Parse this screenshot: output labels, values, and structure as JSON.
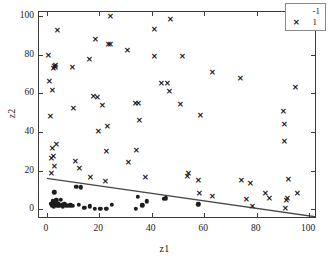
{
  "chart_data": {
    "type": "scatter",
    "title": "",
    "xlabel": "z1",
    "ylabel": "z2",
    "xlim": [
      -3,
      103
    ],
    "ylim": [
      -5,
      102
    ],
    "xticks": [
      0,
      20,
      40,
      60,
      80,
      100
    ],
    "yticks": [
      0,
      20,
      40,
      60,
      80,
      100
    ],
    "grid": false,
    "legend_position": "upper-right",
    "series": [
      {
        "name": "-1",
        "marker": "filled-circle",
        "color": "#1c1c1c",
        "points": [
          [
            1.5,
            3.0
          ],
          [
            2.0,
            2.0
          ],
          [
            2.2,
            4.2
          ],
          [
            2.6,
            1.6
          ],
          [
            3.0,
            3.4
          ],
          [
            3.3,
            2.2
          ],
          [
            3.6,
            4.6
          ],
          [
            2.8,
            8.8
          ],
          [
            4.0,
            2.0
          ],
          [
            4.4,
            3.0
          ],
          [
            4.8,
            1.8
          ],
          [
            5.2,
            5.0
          ],
          [
            5.6,
            2.4
          ],
          [
            6.0,
            1.6
          ],
          [
            6.6,
            2.8
          ],
          [
            7.2,
            2.0
          ],
          [
            8.0,
            1.8
          ],
          [
            9.0,
            2.0
          ],
          [
            10.0,
            1.8
          ],
          [
            11.2,
            11.6
          ],
          [
            12.2,
            2.2
          ],
          [
            13.0,
            11.4
          ],
          [
            14.2,
            0.8
          ],
          [
            16.4,
            1.6
          ],
          [
            18.2,
            0.2
          ],
          [
            20.4,
            0.2
          ],
          [
            22.6,
            0.4
          ],
          [
            24.8,
            2.2
          ],
          [
            33.8,
            0.4
          ],
          [
            34.6,
            6.4
          ],
          [
            36.4,
            2.0
          ],
          [
            38.2,
            4.2
          ],
          [
            44.6,
            5.4
          ],
          [
            45.4,
            5.6
          ],
          [
            57.8,
            2.6
          ]
        ]
      },
      {
        "name": "1",
        "marker": "x",
        "color": "#1c1c1c",
        "points": [
          [
            0.6,
            79.2
          ],
          [
            1.0,
            65.8
          ],
          [
            1.2,
            47.8
          ],
          [
            1.4,
            18.4
          ],
          [
            1.6,
            26.2
          ],
          [
            1.8,
            31.0
          ],
          [
            2.0,
            61.0
          ],
          [
            2.4,
            72.4
          ],
          [
            2.8,
            73.6
          ],
          [
            3.0,
            73.0
          ],
          [
            3.2,
            74.0
          ],
          [
            2.2,
            27.0
          ],
          [
            2.6,
            22.0
          ],
          [
            3.6,
            33.4
          ],
          [
            4.0,
            92.0
          ],
          [
            9.6,
            73.0
          ],
          [
            10.0,
            52.0
          ],
          [
            10.6,
            24.4
          ],
          [
            12.4,
            21.0
          ],
          [
            16.0,
            77.4
          ],
          [
            16.4,
            16.2
          ],
          [
            17.6,
            58.0
          ],
          [
            18.4,
            87.4
          ],
          [
            19.2,
            57.6
          ],
          [
            19.6,
            40.0
          ],
          [
            21.0,
            53.6
          ],
          [
            22.0,
            14.0
          ],
          [
            22.6,
            29.6
          ],
          [
            23.0,
            42.6
          ],
          [
            23.4,
            85.0
          ],
          [
            24.0,
            85.2
          ],
          [
            24.2,
            99.4
          ],
          [
            30.4,
            81.6
          ],
          [
            30.8,
            24.2
          ],
          [
            33.6,
            54.4
          ],
          [
            34.0,
            30.0
          ],
          [
            34.6,
            54.6
          ],
          [
            35.0,
            45.4
          ],
          [
            37.4,
            16.4
          ],
          [
            40.8,
            78.6
          ],
          [
            41.0,
            92.6
          ],
          [
            43.4,
            64.6
          ],
          [
            45.8,
            64.8
          ],
          [
            46.4,
            60.6
          ],
          [
            46.8,
            98.0
          ],
          [
            50.6,
            54.0
          ],
          [
            51.4,
            78.8
          ],
          [
            53.6,
            16.8
          ],
          [
            54.0,
            18.4
          ],
          [
            57.6,
            14.8
          ],
          [
            58.0,
            7.8
          ],
          [
            58.4,
            48.0
          ],
          [
            62.8,
            6.6
          ],
          [
            63.0,
            70.4
          ],
          [
            73.6,
            67.6
          ],
          [
            74.2,
            14.8
          ],
          [
            75.8,
            4.8
          ],
          [
            77.6,
            13.2
          ],
          [
            78.4,
            1.2
          ],
          [
            83.2,
            8.0
          ],
          [
            84.8,
            5.4
          ],
          [
            90.0,
            50.2
          ],
          [
            90.4,
            35.0
          ],
          [
            90.6,
            43.8
          ],
          [
            90.8,
            0.2
          ],
          [
            91.0,
            4.4
          ],
          [
            91.6,
            5.2
          ],
          [
            92.0,
            15.4
          ],
          [
            94.8,
            62.8
          ],
          [
            95.2,
            7.8
          ]
        ]
      }
    ],
    "decision_boundary": {
      "label": "decision-boundary",
      "color": "#4a4a4a",
      "x_start": 0,
      "y_start": 16.0,
      "x_end": 103,
      "y_end": -4.0
    }
  },
  "legend": {
    "entries": [
      {
        "label": "-1",
        "marker": "filled-circle"
      },
      {
        "label": "1",
        "marker": "x"
      }
    ]
  },
  "axes": {
    "x_title": "z1",
    "y_title": "z2",
    "x_tick_labels": [
      "0",
      "20",
      "40",
      "60",
      "80",
      "100"
    ],
    "y_tick_labels": [
      "0",
      "20",
      "40",
      "60",
      "80",
      "100"
    ]
  }
}
